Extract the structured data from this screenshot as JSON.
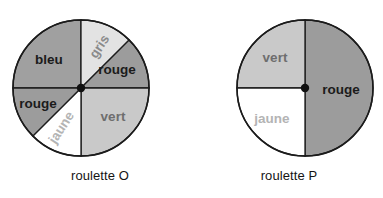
{
  "figure": {
    "kind": "two-spinner-probability-figure",
    "background": "#ffffff"
  },
  "palette": {
    "dark_gray": "#a0a0a0",
    "medium_gray": "#9c9c9c",
    "light_gray": "#c9c9c9",
    "very_light_gray": "#e3e3e3",
    "white": "#ffffff",
    "outline": "#1b1b1b",
    "hub_dot": "#111111",
    "label_dark": "#1b1b1b",
    "label_mid": "#6e6e6e",
    "label_light": "#9a9a9a"
  },
  "wheels": [
    {
      "id": "roulette-o",
      "caption": "roulette O",
      "center": {
        "x": 81,
        "y": 88
      },
      "radius": 68,
      "sectors": [
        {
          "name": "bleu",
          "label": "bleu",
          "start_deg": 270,
          "end_deg": 360,
          "sweep_deg": 90,
          "fraction": "1/4",
          "fill": "#a0a0a0",
          "label_fill": "#1b1b1b",
          "label_rotation_deg": 0,
          "label_x": 49,
          "label_y": 60
        },
        {
          "name": "gris",
          "label": "gris",
          "start_deg": 0,
          "end_deg": 45,
          "sweep_deg": 45,
          "fraction": "1/8",
          "fill": "#e3e3e3",
          "label_fill": "#8a8a8a",
          "label_rotation_deg": -57,
          "label_x": 100,
          "label_y": 47
        },
        {
          "name": "rouge-upper",
          "label": "rouge",
          "start_deg": 45,
          "end_deg": 90,
          "sweep_deg": 45,
          "fraction": "1/8",
          "fill": "#9c9c9c",
          "label_fill": "#1b1b1b",
          "label_rotation_deg": 0,
          "label_x": 117,
          "label_y": 70
        },
        {
          "name": "vert",
          "label": "vert",
          "start_deg": 90,
          "end_deg": 180,
          "sweep_deg": 90,
          "fraction": "1/4",
          "fill": "#c9c9c9",
          "label_fill": "#6e6e6e",
          "label_rotation_deg": 0,
          "label_x": 113,
          "label_y": 117
        },
        {
          "name": "jaune",
          "label": "jaune",
          "start_deg": 180,
          "end_deg": 225,
          "sweep_deg": 45,
          "fraction": "1/8",
          "fill": "#ffffff",
          "label_fill": "#b4b4b4",
          "label_rotation_deg": -57,
          "label_x": 62,
          "label_y": 128
        },
        {
          "name": "rouge-lower",
          "label": "rouge",
          "start_deg": 225,
          "end_deg": 270,
          "sweep_deg": 45,
          "fraction": "1/8",
          "fill": "#9c9c9c",
          "label_fill": "#1b1b1b",
          "label_rotation_deg": 0,
          "label_x": 38,
          "label_y": 104
        }
      ]
    },
    {
      "id": "roulette-p",
      "caption": "roulette P",
      "center": {
        "x": 305,
        "y": 88
      },
      "radius": 68,
      "sectors": [
        {
          "name": "rouge",
          "label": "rouge",
          "start_deg": 0,
          "end_deg": 180,
          "sweep_deg": 180,
          "fraction": "1/2",
          "fill": "#9c9c9c",
          "label_fill": "#1b1b1b",
          "label_rotation_deg": 0,
          "label_x": 341,
          "label_y": 90
        },
        {
          "name": "vert",
          "label": "vert",
          "start_deg": 270,
          "end_deg": 360,
          "sweep_deg": 90,
          "fraction": "1/4",
          "fill": "#c9c9c9",
          "label_fill": "#6e6e6e",
          "label_rotation_deg": 0,
          "label_x": 275,
          "label_y": 58
        },
        {
          "name": "jaune",
          "label": "jaune",
          "start_deg": 180,
          "end_deg": 270,
          "sweep_deg": 90,
          "fraction": "1/4",
          "fill": "#ffffff",
          "label_fill": "#b4b4b4",
          "label_rotation_deg": 0,
          "label_x": 272,
          "label_y": 119
        }
      ]
    }
  ]
}
